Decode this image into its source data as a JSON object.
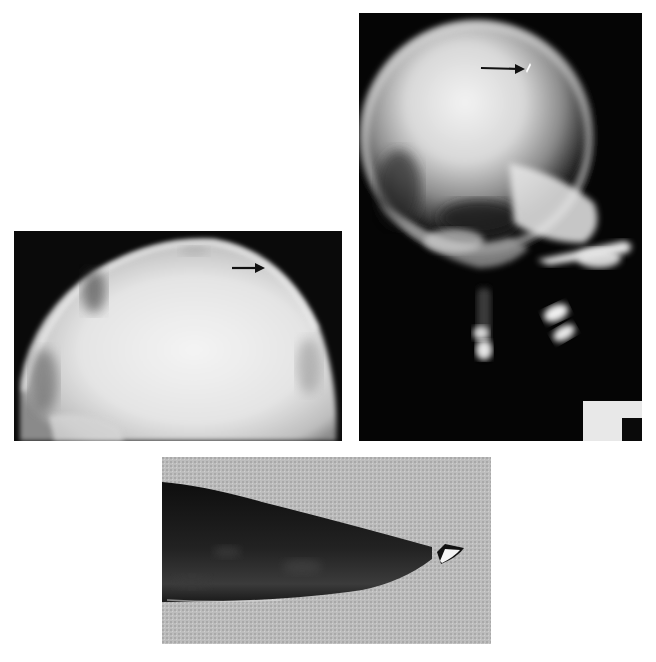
{
  "figure": {
    "panels": [
      {
        "id": "lateral-skull-xray",
        "description": "Lateral skull radiograph with small bright metallic fragment at vertex",
        "annotation": "arrow pointing to fragment"
      },
      {
        "id": "vault-xray",
        "description": "Tangential radiograph of skull vault",
        "annotation": "arrow pointing to outer table defect"
      },
      {
        "id": "knife-photo",
        "description": "Photograph of knife blade with broken-off tip fragment",
        "annotation": "tip fragment"
      }
    ],
    "colors": {
      "background": "#ffffff",
      "xray_dark": "#050505",
      "bone_bright": "#e8e8e8",
      "cloth": "#b9b9b9",
      "blade": "#1a1a1a"
    }
  }
}
